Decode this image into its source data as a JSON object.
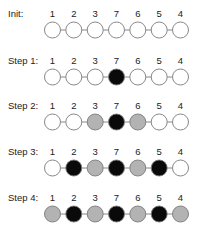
{
  "diagram": {
    "node_values": [
      "1",
      "2",
      "3",
      "7",
      "6",
      "5",
      "4"
    ],
    "colors": {
      "white": "#ffffff",
      "black": "#0a0a0a",
      "gray": "#b3b3b3",
      "stroke": "#7a7a7a"
    },
    "rows": [
      {
        "label": "Init:",
        "states": [
          "white",
          "white",
          "white",
          "white",
          "white",
          "white",
          "white"
        ]
      },
      {
        "label": "Step 1:",
        "states": [
          "white",
          "white",
          "white",
          "black",
          "white",
          "white",
          "white"
        ]
      },
      {
        "label": "Step 2:",
        "states": [
          "white",
          "white",
          "gray",
          "black",
          "gray",
          "white",
          "white"
        ]
      },
      {
        "label": "Step 3:",
        "states": [
          "white",
          "black",
          "gray",
          "black",
          "gray",
          "black",
          "white"
        ]
      },
      {
        "label": "Step 4:",
        "states": [
          "gray",
          "black",
          "gray",
          "black",
          "gray",
          "black",
          "gray"
        ]
      }
    ]
  }
}
